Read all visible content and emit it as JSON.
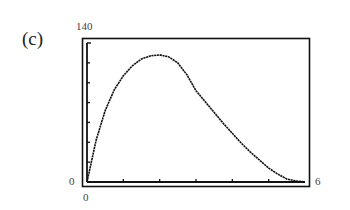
{
  "panel_label": "(c)",
  "axis_labels": {
    "ymax": "140",
    "ymin": "0",
    "xmin": "0",
    "xmax": "6"
  },
  "chart_data": {
    "type": "line",
    "title": "",
    "xlabel": "",
    "ylabel": "",
    "xlim": [
      0,
      6
    ],
    "ylim": [
      0,
      140
    ],
    "x_ticks": [
      1,
      2,
      3,
      4,
      5
    ],
    "y_ticks": [
      20,
      40,
      60,
      80,
      100,
      120
    ],
    "grid": false,
    "legend": null,
    "series": [
      {
        "name": "curve",
        "x": [
          0,
          0.25,
          0.5,
          0.75,
          1,
          1.25,
          1.5,
          1.75,
          2,
          2.25,
          2.5,
          2.75,
          3,
          3.25,
          3.5,
          3.75,
          4,
          4.25,
          4.5,
          4.75,
          5,
          5.25,
          5.5,
          5.75,
          6
        ],
        "y": [
          0,
          42,
          72,
          93,
          107,
          117,
          124,
          127,
          128,
          126,
          120,
          108,
          92,
          81,
          70,
          59,
          49,
          39,
          30,
          22,
          14,
          8,
          3,
          1,
          0
        ]
      }
    ]
  }
}
